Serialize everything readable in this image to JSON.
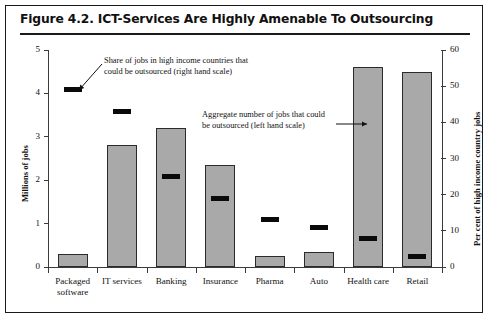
{
  "figure": {
    "title": "Figure 4.2.  ICT-Services Are Highly Amenable To Outsourcing"
  },
  "chart_data": {
    "type": "bar",
    "title": "Figure 4.2.  ICT-Services Are Highly Amenable To Outsourcing",
    "xlabel": "",
    "ylabel": "Millions of jobs",
    "y2label": "Per cent of high income country jobs",
    "ylim": [
      0,
      5
    ],
    "y2lim": [
      0,
      60
    ],
    "yticks": [
      "0",
      "1",
      "2",
      "3",
      "4",
      "5"
    ],
    "y2ticks": [
      "0",
      "10",
      "20",
      "30",
      "40",
      "50",
      "60"
    ],
    "grid": false,
    "legend_position": "annotations",
    "categories": [
      "Packaged\nsoftware",
      "IT services",
      "Banking",
      "Insurance",
      "Pharma",
      "Auto",
      "Health care",
      "Retail"
    ],
    "series": [
      {
        "name": "Aggregate number of jobs that could be outsourced (left hand scale)",
        "type": "bar",
        "axis": "left",
        "unit": "Millions of jobs",
        "values": [
          0.3,
          2.8,
          3.2,
          2.35,
          0.25,
          0.35,
          4.6,
          4.5
        ]
      },
      {
        "name": "Share of jobs in high income countries that could be outsourced (right hand scale)",
        "type": "marker",
        "axis": "right",
        "unit": "Per cent of high income country jobs",
        "values": [
          49,
          43,
          25,
          19,
          13,
          11,
          8,
          3
        ]
      }
    ],
    "annotations": [
      {
        "id": "right-scale-note",
        "text": "Share of jobs in high income countries that\ncould be outsourced (right hand scale)"
      },
      {
        "id": "left-scale-note",
        "text": "Aggregate number of jobs that could\nbe outsourced (left hand scale)"
      }
    ],
    "colors": {
      "bar_fill": "#a9a9a9",
      "bar_border": "#2b2b2b",
      "marker": "#0a0a0a",
      "axis": "#3b3b3b",
      "frame": "#1a1a1a",
      "background": "#ffffff"
    }
  }
}
